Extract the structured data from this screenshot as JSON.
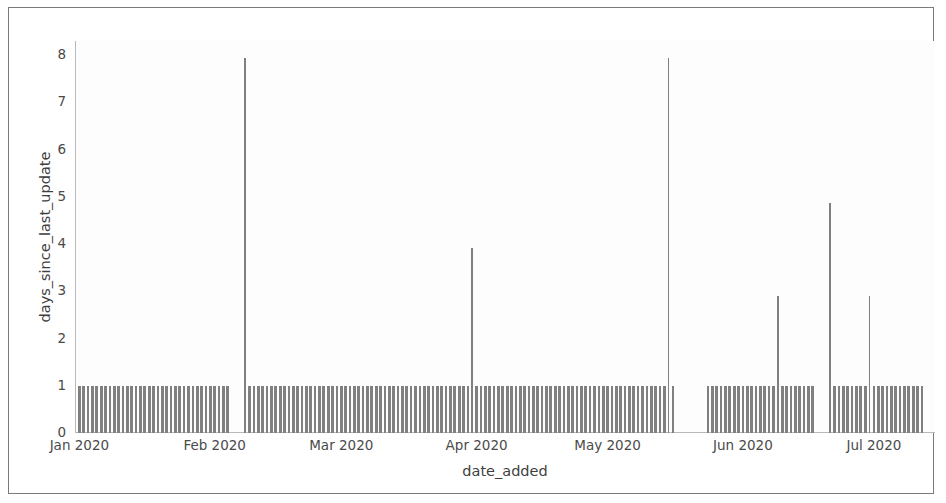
{
  "chart_data": {
    "type": "bar",
    "title": "",
    "xlabel": "date_added",
    "ylabel": "days_since_last_update",
    "grid": false,
    "legend": null,
    "ylim": [
      0,
      8.3
    ],
    "yticks": [
      0,
      1,
      2,
      3,
      4,
      5,
      6,
      7,
      8
    ],
    "ytick_labels": [
      "0",
      "1",
      "2",
      "3",
      "4",
      "5",
      "6",
      "7",
      "8"
    ],
    "xtick_labels": [
      "Jan 2020",
      "Feb 2020",
      "Mar 2020",
      "Apr 2020",
      "May 2020",
      "Jun 2020",
      "Jul 2020"
    ],
    "xtick_positions_day": [
      0,
      31,
      60,
      91,
      121,
      152,
      182
    ],
    "x_range_days": [
      -1,
      196
    ],
    "bar_color": "#808080",
    "background_color": "#ffffff",
    "plot_background_color": "#fdfdfd",
    "axis_color": "#b9b9b9",
    "tick_label_color": "#4a4a4a",
    "note": "Daily bars from Jan 2020 through mid-Jul 2020; value is days since previous update. Most days = 1. Gaps = days with no record.",
    "categories_day_index": [
      0,
      1,
      2,
      3,
      4,
      5,
      6,
      7,
      8,
      9,
      10,
      11,
      12,
      13,
      14,
      15,
      16,
      17,
      18,
      19,
      20,
      21,
      22,
      23,
      24,
      25,
      26,
      27,
      28,
      29,
      30,
      31,
      32,
      33,
      34,
      38,
      39,
      40,
      41,
      42,
      43,
      44,
      45,
      46,
      47,
      48,
      49,
      50,
      51,
      52,
      53,
      54,
      55,
      56,
      57,
      58,
      59,
      60,
      61,
      62,
      63,
      64,
      65,
      66,
      67,
      68,
      69,
      70,
      71,
      72,
      73,
      74,
      75,
      76,
      77,
      78,
      79,
      80,
      81,
      82,
      83,
      84,
      85,
      86,
      87,
      88,
      89,
      90,
      91,
      92,
      93,
      94,
      95,
      96,
      97,
      98,
      99,
      100,
      101,
      102,
      103,
      104,
      105,
      106,
      107,
      108,
      109,
      110,
      111,
      112,
      113,
      114,
      115,
      116,
      117,
      118,
      119,
      120,
      121,
      122,
      123,
      124,
      125,
      126,
      127,
      128,
      129,
      130,
      131,
      132,
      133,
      134,
      135,
      136,
      144,
      145,
      146,
      147,
      148,
      149,
      150,
      151,
      152,
      153,
      154,
      155,
      156,
      157,
      158,
      159,
      160,
      161,
      162,
      163,
      164,
      165,
      166,
      167,
      168,
      172,
      173,
      174,
      175,
      176,
      177,
      178,
      179,
      180,
      181,
      182,
      183,
      184,
      185,
      186,
      187,
      188,
      189,
      190,
      191,
      192,
      193
    ],
    "values": [
      1,
      1,
      1,
      1,
      1,
      1,
      1,
      1,
      1,
      1,
      1,
      1,
      1,
      1,
      1,
      1,
      1,
      1,
      1,
      1,
      1,
      1,
      1,
      1,
      1,
      1,
      1,
      1,
      1,
      1,
      1,
      1,
      1,
      1,
      1,
      7.95,
      1,
      1,
      1,
      1,
      1,
      1,
      1,
      1,
      1,
      1,
      1,
      1,
      1,
      1,
      1,
      1,
      1,
      1,
      1,
      1,
      1,
      1,
      1,
      1,
      1,
      1,
      1,
      1,
      1,
      1,
      1,
      1,
      1,
      1,
      1,
      1,
      1,
      1,
      1,
      1,
      1,
      1,
      1,
      1,
      1,
      1,
      1,
      1,
      1,
      1,
      1,
      3.92,
      1,
      1,
      1,
      1,
      1,
      1,
      1,
      1,
      1,
      1,
      1,
      1,
      1,
      1,
      1,
      1,
      1,
      1,
      1,
      1,
      1,
      1,
      1,
      1,
      1,
      1,
      1,
      1,
      1,
      1,
      1,
      1,
      1,
      1,
      1,
      1,
      1,
      1,
      1,
      1,
      1,
      1,
      1,
      1,
      7.95,
      1,
      1,
      1,
      1,
      1,
      1,
      1,
      1,
      1,
      1,
      1,
      1,
      1,
      1,
      1,
      1,
      1,
      2.9,
      1,
      1,
      1,
      1,
      1,
      1,
      1,
      1,
      4.88,
      1,
      1,
      1,
      1,
      1,
      1,
      1,
      1,
      2.9,
      1,
      1,
      1,
      1,
      1,
      1,
      1,
      1,
      1,
      1,
      1,
      1,
      1,
      1
    ],
    "spikes": [
      {
        "label": "early Feb 2020",
        "day_index": 38,
        "value": 7.95
      },
      {
        "label": "late Mar 2020",
        "day_index": 87,
        "value": 3.92
      },
      {
        "label": "late May 2020",
        "day_index": 144,
        "value": 7.95
      },
      {
        "label": "early Jun 2020",
        "day_index": 165,
        "value": 2.9
      },
      {
        "label": "late Jun 2020",
        "day_index": 174,
        "value": 4.88
      },
      {
        "label": "early Jul 2020",
        "day_index": 186,
        "value": 2.9
      }
    ],
    "gaps_day_index": [
      [
        35,
        37
      ],
      [
        137,
        143
      ],
      [
        169,
        171
      ]
    ]
  }
}
